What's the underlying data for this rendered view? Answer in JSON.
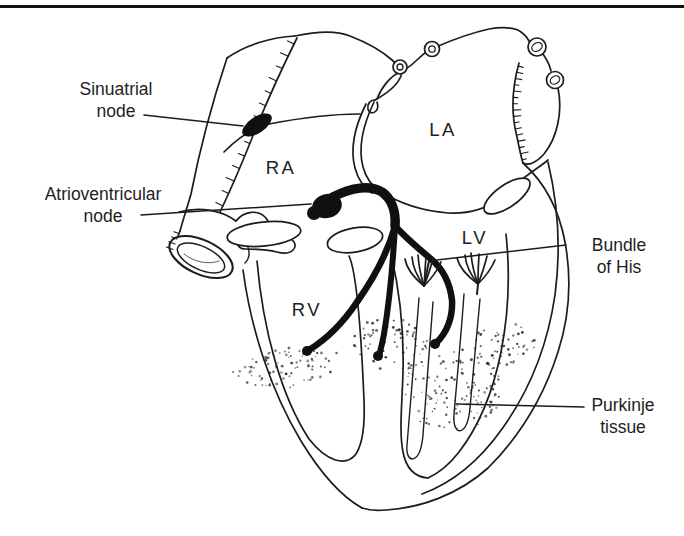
{
  "diagram": {
    "type": "heart-conduction-system-figure",
    "ink_color": "#1c1c1c",
    "paper_color": "#ffffff",
    "labels": {
      "sinuatrial": {
        "line1": "Sinuatrial",
        "line2": "node"
      },
      "atrioventricular": {
        "line1": "Atrioventricular",
        "line2": "node"
      },
      "bundle_of_his": {
        "line1": "Bundle",
        "line2": "of His"
      },
      "purkinje": {
        "line1": "Purkinje",
        "line2": "tissue"
      }
    },
    "chambers": {
      "right_atrium": "RA",
      "left_atrium": "LA",
      "left_ventricle": "LV",
      "right_ventricle": "RV"
    }
  }
}
